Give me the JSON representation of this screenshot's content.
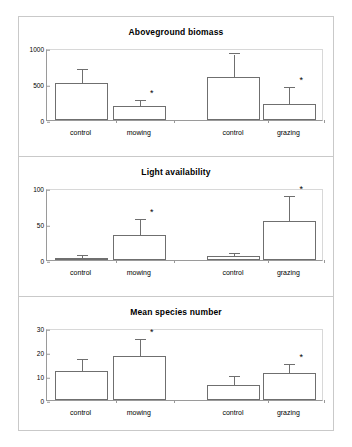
{
  "figure": {
    "panels": [
      {
        "title": "Aboveground biomass",
        "ylim": [
          0,
          1000
        ],
        "yticks": [
          "0",
          "500",
          "1000"
        ],
        "ytick_values": [
          0,
          500,
          1000
        ]
      },
      {
        "title": "Light availability",
        "ylim": [
          0,
          100
        ],
        "yticks": [
          "0",
          "50",
          "100"
        ],
        "ytick_values": [
          0,
          50,
          100
        ]
      },
      {
        "title": "Mean species number",
        "ylim": [
          0,
          30
        ],
        "yticks": [
          "0",
          "10",
          "20",
          "30"
        ],
        "ytick_values": [
          0,
          10,
          20,
          30
        ]
      }
    ]
  },
  "chart_data": [
    {
      "type": "bar",
      "title": "Aboveground biomass",
      "xlabel": "",
      "ylabel": "",
      "ylim": [
        0,
        1000
      ],
      "yticks": [
        0,
        500,
        1000
      ],
      "grid": false,
      "legend": "none",
      "categories": [
        "control",
        "mowing",
        "control",
        "grazing"
      ],
      "values": [
        510,
        190,
        600,
        225
      ],
      "errors": [
        185,
        75,
        310,
        215
      ],
      "significance": [
        "",
        "*",
        "",
        "*"
      ]
    },
    {
      "type": "bar",
      "title": "Light availability",
      "xlabel": "",
      "ylabel": "",
      "ylim": [
        0,
        100
      ],
      "yticks": [
        0,
        50,
        100
      ],
      "grid": false,
      "legend": "none",
      "categories": [
        "control",
        "mowing",
        "control",
        "grazing"
      ],
      "values": [
        3,
        35,
        5,
        54
      ],
      "errors": [
        3,
        21,
        3,
        34
      ],
      "significance": [
        "",
        "*",
        "",
        "*"
      ]
    },
    {
      "type": "bar",
      "title": "Mean species number",
      "xlabel": "",
      "ylabel": "",
      "ylim": [
        0,
        30
      ],
      "yticks": [
        0,
        10,
        20,
        30
      ],
      "grid": false,
      "legend": "none",
      "categories": [
        "control",
        "mowing",
        "control",
        "grazing"
      ],
      "values": [
        12,
        18.2,
        6.4,
        11.3
      ],
      "errors": [
        4.8,
        7,
        3.2,
        3.2
      ],
      "significance": [
        "",
        "*",
        "",
        "*"
      ]
    }
  ]
}
